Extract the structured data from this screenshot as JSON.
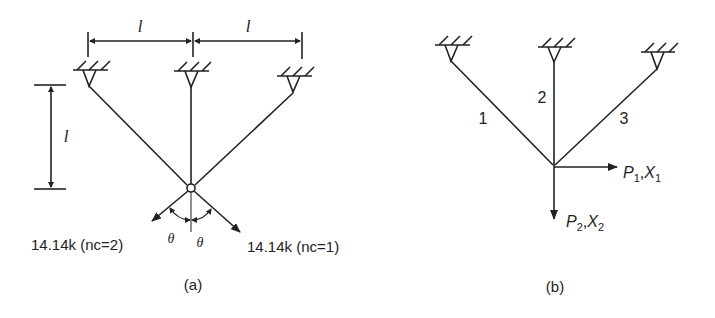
{
  "figure": {
    "panel_a": {
      "caption": "(a)",
      "dim_horizontal_left": "l",
      "dim_horizontal_right": "l",
      "dim_vertical": "l",
      "angle_left": "θ",
      "angle_right": "θ",
      "load_left": "14.14k (nc=2)",
      "load_right": "14.14k (nc=1)"
    },
    "panel_b": {
      "caption": "(b)",
      "member_1": "1",
      "member_2": "2",
      "member_3": "3",
      "dof_1": {
        "p": "P",
        "p_sub": "1",
        "sep": ",",
        "x": "X",
        "x_sub": "1"
      },
      "dof_2": {
        "p": "P",
        "p_sub": "2",
        "sep": ",",
        "x": "X",
        "x_sub": "2"
      }
    },
    "colors": {
      "ink": "#222222",
      "background": "#ffffff"
    }
  }
}
